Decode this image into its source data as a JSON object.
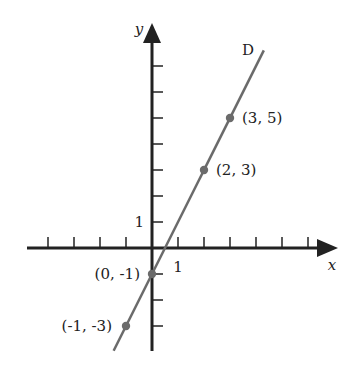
{
  "chart_data": {
    "type": "line",
    "title": "",
    "xlabel": "x",
    "ylabel": "y",
    "xlim": [
      -5,
      7
    ],
    "ylim": [
      -4,
      8.5
    ],
    "grid": false,
    "line_label": "D",
    "equation": "y = 2x - 1",
    "points": [
      {
        "x": -1,
        "y": -3,
        "label": "(-1, -3)"
      },
      {
        "x": 0,
        "y": -1,
        "label": "(0, -1)"
      },
      {
        "x": 2,
        "y": 3,
        "label": "(2, 3)"
      },
      {
        "x": 3,
        "y": 5,
        "label": "(3, 5)"
      }
    ],
    "x_ticks": [
      -4,
      -3,
      -2,
      -1,
      1,
      2,
      3,
      4,
      5,
      6
    ],
    "y_ticks": [
      -3,
      -2,
      -1,
      1,
      2,
      3,
      4,
      5,
      6,
      7
    ],
    "x_tick_labels": [
      {
        "value": 1,
        "text": "1"
      }
    ],
    "y_tick_labels": [
      {
        "value": 1,
        "text": "1"
      }
    ]
  },
  "colors": {
    "axis": "#222222",
    "line": "#6b6b6b",
    "point": "#6b6b6b"
  }
}
